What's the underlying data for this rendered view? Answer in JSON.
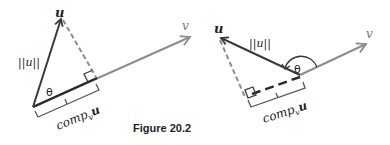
{
  "figure": {
    "caption": "Figure 20.2",
    "colors": {
      "u_vector": "#3a3a3a",
      "v_vector": "#8c8c8c",
      "dashed": "#8c8c8c",
      "projection": "#2a2a2a",
      "bracket": "#555555",
      "text": "#222222"
    }
  },
  "left_diagram": {
    "u_label": "u",
    "v_label": "v",
    "norm_label": "||u||",
    "angle_label": "θ",
    "comp_label_main": "comp",
    "comp_label_sub": "v",
    "comp_label_vec": "u",
    "angle_type": "acute"
  },
  "right_diagram": {
    "u_label": "u",
    "v_label": "v",
    "norm_label": "||u||",
    "angle_label": "θ",
    "comp_label_main": "comp",
    "comp_label_sub": "v",
    "comp_label_vec": "u",
    "angle_type": "obtuse"
  }
}
